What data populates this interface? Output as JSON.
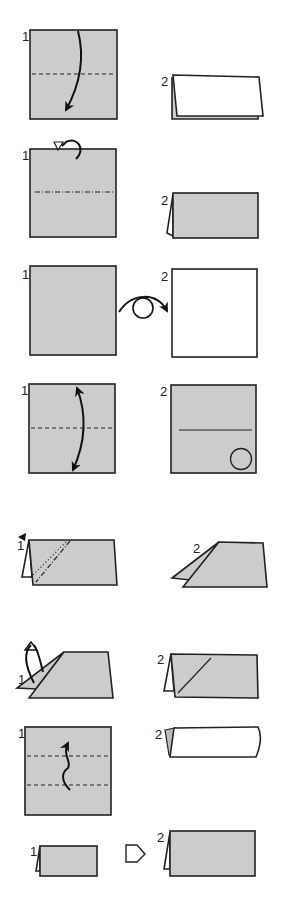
{
  "diagram": {
    "type": "origami-folding-instructions",
    "colors": {
      "paper_colored": "#cccccc",
      "paper_white": "#ffffff",
      "line": "#222222",
      "background": "#ffffff"
    },
    "rows": [
      {
        "id": "row1",
        "step1_label": "1",
        "step2_label": "2",
        "description": "Valley fold in half downward (dashed line with curved arrow)"
      },
      {
        "id": "row2",
        "step1_label": "1",
        "step2_label": "2",
        "description": "Mountain fold in half behind (dash-dot line, looped arrow)"
      },
      {
        "id": "row3",
        "step1_label": "1",
        "step2_label": "2",
        "description": "Turn over (arrow with circle between squares)"
      },
      {
        "id": "row4",
        "step1_label": "1",
        "step2_label": "2",
        "description": "Fold and unfold (double-headed arrow), resulting crease with circle marker"
      },
      {
        "id": "row5",
        "step1_label": "1",
        "step2_label": "2",
        "description": "Inside reverse fold (black triangle marker, dotted and dash-dot diagonal lines)"
      },
      {
        "id": "row6",
        "step1_label": "1",
        "step2_label": "2",
        "description": "Outside reverse / unfold flap (upward looped arrows), diagonal crease remains"
      },
      {
        "id": "row7",
        "step1_label": "1",
        "step2_label": "2",
        "description": "Pleat fold (two dashed lines with zigzag arrow), result rolled edge"
      },
      {
        "id": "row8",
        "step1_label": "1",
        "step2_label": "2",
        "description": "Enlarged view (hollow arrow pointing right)"
      }
    ]
  }
}
